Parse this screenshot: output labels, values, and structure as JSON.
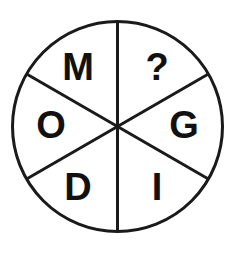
{
  "figure": {
    "shape": "circle",
    "sector_count": 6,
    "stroke_color": "#1a1a1a",
    "background_color": "#ffffff",
    "text_color": "#111111",
    "center_x": 117.5,
    "center_y": 126.5,
    "radius": 105,
    "stroke_width": 3,
    "divider_angles_deg": [
      90,
      30,
      150
    ]
  },
  "sectors": [
    {
      "id": "sector-top-left",
      "label": "M",
      "position_deg": 120,
      "x": 78,
      "y": 69
    },
    {
      "id": "sector-top-right",
      "label": "?",
      "position_deg": 60,
      "x": 157,
      "y": 69
    },
    {
      "id": "sector-left",
      "label": "O",
      "position_deg": 180,
      "x": 51,
      "y": 127
    },
    {
      "id": "sector-right",
      "label": "G",
      "position_deg": 0,
      "x": 184,
      "y": 127
    },
    {
      "id": "sector-bottom-left",
      "label": "D",
      "position_deg": 240,
      "x": 78,
      "y": 189
    },
    {
      "id": "sector-bottom-right",
      "label": "I",
      "position_deg": 300,
      "x": 157,
      "y": 189
    }
  ]
}
